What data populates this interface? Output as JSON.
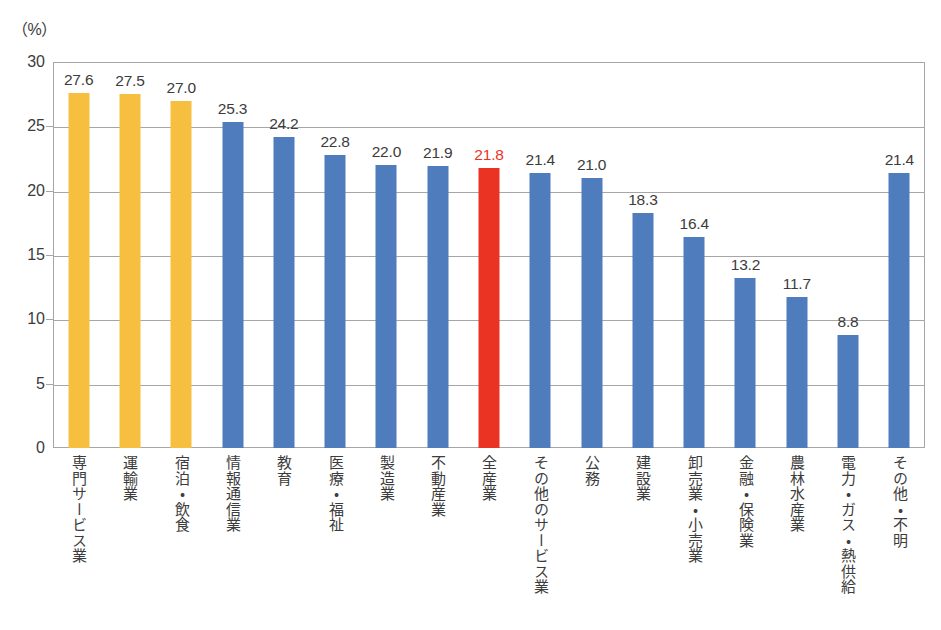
{
  "chart_data": {
    "type": "bar",
    "title": "",
    "subtitle": "",
    "unit_label": "（%）",
    "xlabel": "",
    "ylabel": "",
    "ylim": [
      0,
      30
    ],
    "ytick_step": 5,
    "yticks": [
      "0",
      "5",
      "10",
      "15",
      "20",
      "25",
      "30"
    ],
    "grid": true,
    "legend": "none",
    "categories": [
      "専門サービス業",
      "運輸業",
      "宿泊・飲食",
      "情報通信業",
      "教育",
      "医療・福祉",
      "製造業",
      "不動産業",
      "全産業",
      "その他のサービス業",
      "公務",
      "建設業",
      "卸売業・小売業",
      "金融・保険業",
      "農林水産業",
      "電力・ガス・熱供給",
      "その他・不明"
    ],
    "values": [
      27.6,
      27.5,
      27.0,
      25.3,
      24.2,
      22.8,
      22.0,
      21.9,
      21.8,
      21.4,
      21.0,
      18.3,
      16.4,
      13.2,
      11.7,
      8.8,
      21.4
    ],
    "value_labels": [
      "27.6",
      "27.5",
      "27.0",
      "25.3",
      "24.2",
      "22.8",
      "22.0",
      "21.9",
      "21.8",
      "21.4",
      "21.0",
      "18.3",
      "16.4",
      "13.2",
      "11.7",
      "8.8",
      "21.4"
    ],
    "bar_colors": [
      "#f7bf3f",
      "#f7bf3f",
      "#f7bf3f",
      "#4f7cbd",
      "#4f7cbd",
      "#4f7cbd",
      "#4f7cbd",
      "#4f7cbd",
      "#ea3323",
      "#4f7cbd",
      "#4f7cbd",
      "#4f7cbd",
      "#4f7cbd",
      "#4f7cbd",
      "#4f7cbd",
      "#4f7cbd",
      "#4f7cbd"
    ],
    "label_colors": [
      "#3c3c3c",
      "#3c3c3c",
      "#3c3c3c",
      "#3c3c3c",
      "#3c3c3c",
      "#3c3c3c",
      "#3c3c3c",
      "#3c3c3c",
      "#ea3323",
      "#3c3c3c",
      "#3c3c3c",
      "#3c3c3c",
      "#3c3c3c",
      "#3c3c3c",
      "#3c3c3c",
      "#3c3c3c",
      "#3c3c3c"
    ],
    "highlight_index": 8,
    "colors": {
      "orange": "#f7bf3f",
      "blue": "#4f7cbd",
      "red": "#ea3323",
      "axis": "#a6a6a6",
      "text": "#3c3c3c"
    }
  }
}
